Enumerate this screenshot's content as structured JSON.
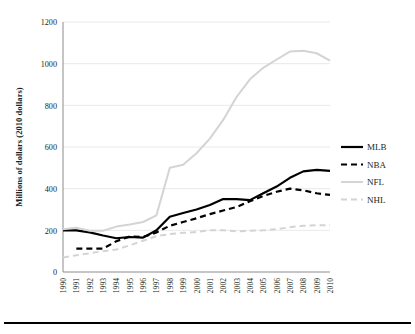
{
  "chart_data": {
    "type": "line",
    "title": "",
    "xlabel": "",
    "ylabel": "Millions of dollars (2010 dollars)",
    "x": [
      1990,
      1991,
      1992,
      1993,
      1994,
      1995,
      1996,
      1997,
      1998,
      1999,
      2000,
      2001,
      2002,
      2003,
      2004,
      2005,
      2006,
      2007,
      2008,
      2009,
      2010
    ],
    "xtick_labels": [
      "1990",
      "1991",
      "1992",
      "1993",
      "1994",
      "1995",
      "1996",
      "1997",
      "1998",
      "1999",
      "2000",
      "2001",
      "2002",
      "2003",
      "2004",
      "2005",
      "2006",
      "2007",
      "2008",
      "2009",
      "2010"
    ],
    "ytick_labels": [
      "0",
      "200",
      "400",
      "600",
      "800",
      "1000",
      "1200"
    ],
    "yticks": [
      0,
      200,
      400,
      600,
      800,
      1000,
      1200
    ],
    "ylim": [
      0,
      1200
    ],
    "xlim": [
      1990,
      2010
    ],
    "grid": "horizontal",
    "legend_position": "right",
    "series": [
      {
        "name": "MLB",
        "color": "#000000",
        "style": "solid",
        "width": 2.2,
        "values": [
          200,
          200,
          190,
          175,
          162,
          168,
          165,
          200,
          265,
          283,
          300,
          322,
          350,
          350,
          345,
          378,
          410,
          452,
          483,
          490,
          485
        ]
      },
      {
        "name": "NBA",
        "color": "#000000",
        "style": "dashed",
        "width": 2.2,
        "values": [
          null,
          112,
          112,
          112,
          148,
          170,
          168,
          190,
          222,
          240,
          258,
          278,
          295,
          312,
          340,
          365,
          385,
          400,
          392,
          378,
          370
        ]
      },
      {
        "name": "NFL",
        "color": "#d4d4d4",
        "style": "solid",
        "width": 2.0,
        "values": [
          205,
          212,
          198,
          198,
          218,
          228,
          240,
          272,
          500,
          515,
          570,
          640,
          730,
          840,
          925,
          980,
          1020,
          1058,
          1062,
          1050,
          1015
        ]
      },
      {
        "name": "NHL",
        "color": "#d4d4d4",
        "style": "dashed",
        "width": 2.0,
        "values": [
          70,
          80,
          90,
          100,
          108,
          128,
          150,
          172,
          182,
          188,
          192,
          200,
          200,
          195,
          198,
          200,
          205,
          215,
          222,
          224,
          224
        ]
      }
    ]
  }
}
